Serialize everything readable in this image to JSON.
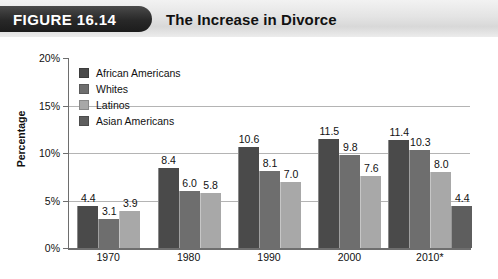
{
  "header": {
    "figure_tag": "FIGURE 16.14",
    "title": "The Increase in Divorce"
  },
  "chart_data": {
    "type": "bar",
    "title": "The Increase in Divorce",
    "xlabel": "",
    "ylabel": "Percentage",
    "ylim": [
      0,
      20
    ],
    "ytick_labels": [
      "0%",
      "5%",
      "10%",
      "15%",
      "20%"
    ],
    "yticks": [
      0,
      5,
      10,
      15,
      20
    ],
    "grid": true,
    "legend_position": "upper-left-inside",
    "categories": [
      "1970",
      "1980",
      "1990",
      "2000",
      "2010*"
    ],
    "series": [
      {
        "name": "African Americans",
        "color": "#4a4a4a",
        "values": [
          4.4,
          8.4,
          10.6,
          11.5,
          11.4
        ],
        "labels": [
          "4.4",
          "8.4",
          "10.6",
          "11.5",
          "11.4"
        ]
      },
      {
        "name": "Whites",
        "color": "#6e6e6e",
        "values": [
          3.1,
          6.0,
          8.1,
          9.8,
          10.3
        ],
        "labels": [
          "3.1",
          "6.0",
          "8.1",
          "9.8",
          "10.3"
        ]
      },
      {
        "name": "Latinos",
        "color": "#a8a8a8",
        "values": [
          3.9,
          5.8,
          7.0,
          7.6,
          8.0
        ],
        "labels": [
          "3.9",
          "5.8",
          "7.0",
          "7.6",
          "8.0"
        ]
      },
      {
        "name": "Asian Americans",
        "color": "#5e5e5e",
        "values": [
          null,
          null,
          null,
          null,
          4.4
        ],
        "labels": [
          "",
          "",
          "",
          "",
          "4.4"
        ]
      }
    ]
  },
  "legend": {
    "items": [
      {
        "label": "African Americans",
        "color": "#4a4a4a"
      },
      {
        "label": "Whites",
        "color": "#6e6e6e"
      },
      {
        "label": "Latinos",
        "color": "#a8a8a8"
      },
      {
        "label": "Asian Americans",
        "color": "#5e5e5e"
      }
    ]
  }
}
